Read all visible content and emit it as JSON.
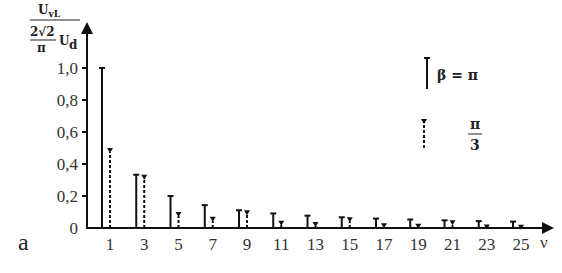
{
  "chart_data": {
    "type": "bar",
    "title": "",
    "panel_label": "a",
    "xlabel": "ν",
    "ylabel": {
      "numerator": "U_vL",
      "denominator": "2√2/π U_d"
    },
    "ylim": [
      0,
      1.0
    ],
    "yticks": [
      "0",
      "0,2",
      "0,4",
      "0,6",
      "0,8",
      "1,0"
    ],
    "categories": [
      "1",
      "3",
      "5",
      "7",
      "9",
      "11",
      "13",
      "15",
      "17",
      "19",
      "21",
      "23",
      "25"
    ],
    "series": [
      {
        "name": "β = π",
        "style": "solid",
        "values": [
          1.0,
          0.333,
          0.2,
          0.143,
          0.111,
          0.091,
          0.077,
          0.067,
          0.059,
          0.053,
          0.048,
          0.043,
          0.04
        ]
      },
      {
        "name": "π/3",
        "style": "dashed",
        "values": [
          0.5,
          0.333,
          0.1,
          0.071,
          0.111,
          0.045,
          0.038,
          0.067,
          0.029,
          0.026,
          0.048,
          0.022,
          0.02
        ]
      }
    ],
    "legend": [
      {
        "label": "β = π",
        "style": "solid"
      },
      {
        "label_num": "π",
        "label_den": "3",
        "style": "dashed"
      }
    ],
    "grid": false,
    "legend_position": "upper right"
  }
}
